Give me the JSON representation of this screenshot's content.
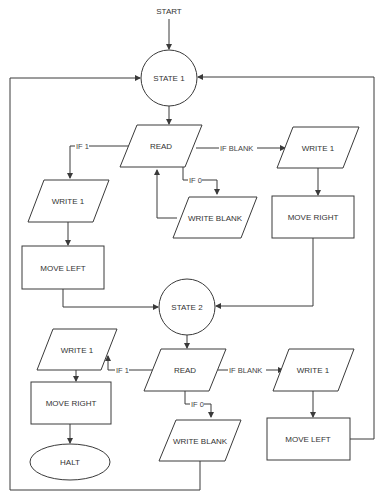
{
  "diagram": {
    "type": "flowchart",
    "colors": {
      "stroke": "#3a3a3a",
      "text": "#333333",
      "background": "#ffffff"
    },
    "start_label": "START",
    "nodes": {
      "state1": {
        "label": "STATE 1",
        "shape": "circle"
      },
      "read1": {
        "label": "READ",
        "shape": "parallelogram"
      },
      "write1_left": {
        "label": "WRITE 1",
        "shape": "parallelogram"
      },
      "move_left_1": {
        "label": "MOVE LEFT",
        "shape": "rectangle"
      },
      "write_blank_1": {
        "label": "WRITE BLANK",
        "shape": "parallelogram"
      },
      "write1_right": {
        "label": "WRITE 1",
        "shape": "parallelogram"
      },
      "move_right_1": {
        "label": "MOVE RIGHT",
        "shape": "rectangle"
      },
      "state2": {
        "label": "STATE 2",
        "shape": "circle"
      },
      "read2": {
        "label": "READ",
        "shape": "parallelogram"
      },
      "write1_left_2": {
        "label": "WRITE 1",
        "shape": "parallelogram"
      },
      "move_right_2": {
        "label": "MOVE RIGHT",
        "shape": "rectangle"
      },
      "halt": {
        "label": "HALT",
        "shape": "ellipse"
      },
      "write_blank_2": {
        "label": "WRITE BLANK",
        "shape": "parallelogram"
      },
      "write1_right_2": {
        "label": "WRITE 1",
        "shape": "parallelogram"
      },
      "move_left_2": {
        "label": "MOVE LEFT",
        "shape": "rectangle"
      }
    },
    "edges": {
      "read1_if1": "IF 1",
      "read1_if0": "IF 0",
      "read1_ifblank": "IF BLANK",
      "read2_if1": "IF 1",
      "read2_if0": "IF 0",
      "read2_ifblank": "IF BLANK"
    },
    "connections": [
      [
        "START",
        "STATE 1"
      ],
      [
        "STATE 1",
        "READ"
      ],
      [
        "READ",
        "WRITE 1 (left)",
        "IF 1"
      ],
      [
        "WRITE 1 (left)",
        "MOVE LEFT"
      ],
      [
        "MOVE LEFT",
        "STATE 2"
      ],
      [
        "READ",
        "WRITE BLANK",
        "IF 0"
      ],
      [
        "WRITE BLANK",
        "READ"
      ],
      [
        "READ",
        "WRITE 1 (right)",
        "IF BLANK"
      ],
      [
        "WRITE 1 (right)",
        "MOVE RIGHT"
      ],
      [
        "MOVE RIGHT",
        "STATE 2"
      ],
      [
        "STATE 2",
        "READ (2)"
      ],
      [
        "READ (2)",
        "WRITE 1 (2, left)",
        "IF 1"
      ],
      [
        "WRITE 1 (2, left)",
        "MOVE RIGHT (2)"
      ],
      [
        "MOVE RIGHT (2)",
        "HALT"
      ],
      [
        "READ (2)",
        "WRITE BLANK (2)",
        "IF 0"
      ],
      [
        "WRITE BLANK (2)",
        "STATE 1"
      ],
      [
        "READ (2)",
        "WRITE 1 (2, right)",
        "IF BLANK"
      ],
      [
        "WRITE 1 (2, right)",
        "MOVE LEFT (2)"
      ],
      [
        "MOVE LEFT (2)",
        "STATE 1"
      ]
    ]
  }
}
